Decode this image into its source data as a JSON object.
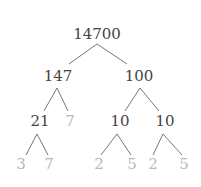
{
  "diagram": {
    "type": "factor-tree",
    "colors": {
      "composite": "#444444",
      "prime": "#b8b8b8",
      "edge": "#777777"
    },
    "nodes": [
      {
        "id": "n14700",
        "label": "14700",
        "x": 97,
        "y": 34,
        "kind": "composite"
      },
      {
        "id": "n147",
        "label": "147",
        "x": 58,
        "y": 76,
        "kind": "composite"
      },
      {
        "id": "n100",
        "label": "100",
        "x": 139,
        "y": 76,
        "kind": "composite"
      },
      {
        "id": "n21",
        "label": "21",
        "x": 40,
        "y": 121,
        "kind": "composite"
      },
      {
        "id": "n7a",
        "label": "7",
        "x": 70,
        "y": 121,
        "kind": "prime"
      },
      {
        "id": "n10a",
        "label": "10",
        "x": 120,
        "y": 121,
        "kind": "composite"
      },
      {
        "id": "n10b",
        "label": "10",
        "x": 165,
        "y": 121,
        "kind": "composite"
      },
      {
        "id": "n3",
        "label": "3",
        "x": 21,
        "y": 164,
        "kind": "prime"
      },
      {
        "id": "n7b",
        "label": "7",
        "x": 49,
        "y": 164,
        "kind": "prime"
      },
      {
        "id": "n2a",
        "label": "2",
        "x": 99,
        "y": 164,
        "kind": "prime"
      },
      {
        "id": "n5a",
        "label": "5",
        "x": 132,
        "y": 164,
        "kind": "prime"
      },
      {
        "id": "n2b",
        "label": "2",
        "x": 153,
        "y": 164,
        "kind": "prime"
      },
      {
        "id": "n5b",
        "label": "5",
        "x": 184,
        "y": 164,
        "kind": "prime"
      }
    ],
    "edges": [
      {
        "from": [
          97,
          44
        ],
        "to": [
          69,
          64
        ]
      },
      {
        "from": [
          97,
          44
        ],
        "to": [
          127,
          64
        ]
      },
      {
        "from": [
          57,
          88
        ],
        "to": [
          44,
          111
        ]
      },
      {
        "from": [
          57,
          88
        ],
        "to": [
          68,
          111
        ]
      },
      {
        "from": [
          140,
          88
        ],
        "to": [
          125,
          111
        ]
      },
      {
        "from": [
          140,
          88
        ],
        "to": [
          159,
          111
        ]
      },
      {
        "from": [
          37,
          134
        ],
        "to": [
          26,
          155
        ]
      },
      {
        "from": [
          37,
          134
        ],
        "to": [
          48,
          155
        ]
      },
      {
        "from": [
          117,
          134
        ],
        "to": [
          101,
          155
        ]
      },
      {
        "from": [
          117,
          134
        ],
        "to": [
          131,
          155
        ]
      },
      {
        "from": [
          163,
          134
        ],
        "to": [
          153,
          155
        ]
      },
      {
        "from": [
          163,
          134
        ],
        "to": [
          182,
          155
        ]
      }
    ]
  }
}
